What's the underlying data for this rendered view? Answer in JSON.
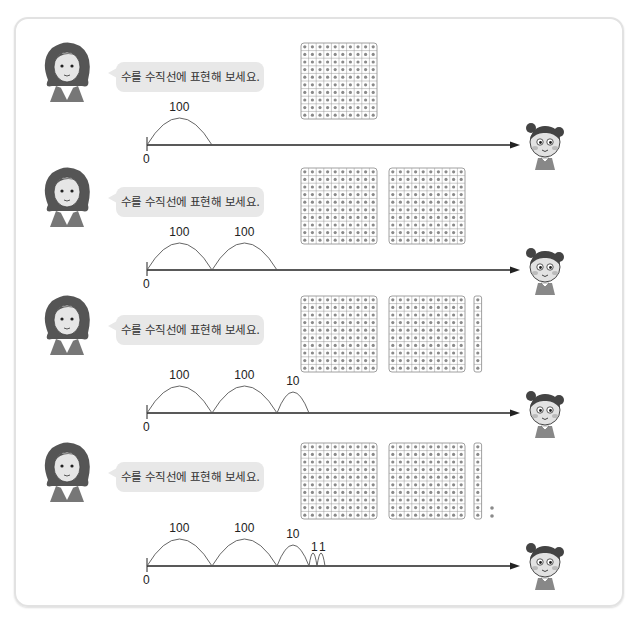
{
  "prompt_text": "수를 수직선에 표현해 보세요.",
  "rows": [
    {
      "jumps": [
        {
          "label": "100",
          "size": 100
        }
      ],
      "blocks": {
        "hundreds": 1,
        "tens": 0,
        "ones": 0
      },
      "zero_label": "0"
    },
    {
      "jumps": [
        {
          "label": "100",
          "size": 100
        },
        {
          "label": "100",
          "size": 100
        }
      ],
      "blocks": {
        "hundreds": 2,
        "tens": 0,
        "ones": 0
      },
      "zero_label": "0"
    },
    {
      "jumps": [
        {
          "label": "100",
          "size": 100
        },
        {
          "label": "100",
          "size": 100
        },
        {
          "label": "10",
          "size": 10
        }
      ],
      "blocks": {
        "hundreds": 2,
        "tens": 1,
        "ones": 0
      },
      "zero_label": "0"
    },
    {
      "jumps": [
        {
          "label": "100",
          "size": 100
        },
        {
          "label": "100",
          "size": 100
        },
        {
          "label": "10",
          "size": 10
        },
        {
          "label": "1",
          "size": 1
        },
        {
          "label": "1",
          "size": 1
        }
      ],
      "blocks": {
        "hundreds": 2,
        "tens": 1,
        "ones": 2
      },
      "zero_label": "0"
    }
  ],
  "colors": {
    "bubble": "#e8e8e8",
    "grid_stroke": "#888888",
    "dot": "#8a8a8a",
    "line": "#222222",
    "arc": "#555555"
  }
}
